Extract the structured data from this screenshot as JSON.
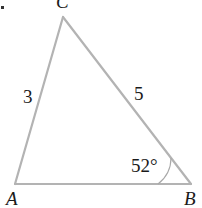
{
  "figure": {
    "type": "triangle",
    "vertices": [
      {
        "label": "A",
        "x": 15,
        "y": 184
      },
      {
        "label": "B",
        "x": 191,
        "y": 184
      },
      {
        "label": "C",
        "x": 63,
        "y": 17
      }
    ],
    "sides": [
      {
        "between": "A-C",
        "label": "3"
      },
      {
        "between": "C-B",
        "label": "5"
      },
      {
        "between": "A-B",
        "label": ""
      }
    ],
    "angles": [
      {
        "vertex": "B",
        "label": "52°"
      }
    ],
    "colors": {
      "edge": "#b3b3b3",
      "text": "#1a1a1a"
    }
  }
}
